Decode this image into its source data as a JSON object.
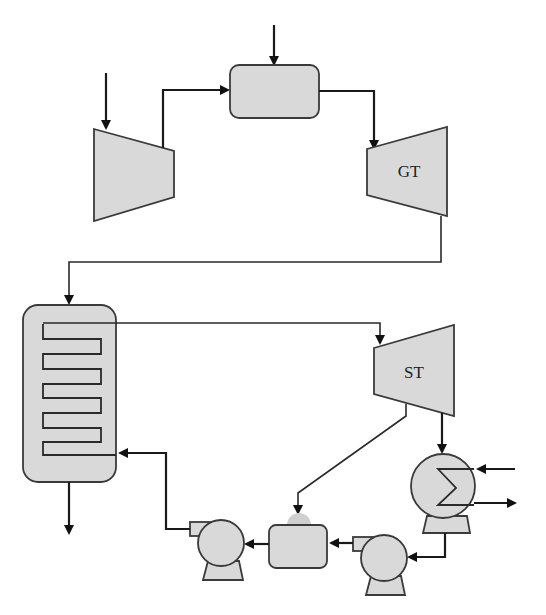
{
  "diagram": {
    "type": "combined-cycle power plant schematic",
    "colors": {
      "fill": "#d9d9d9",
      "stroke": "#3a3a3a",
      "background": "#ffffff"
    },
    "components": [
      {
        "id": "compressor",
        "label": ""
      },
      {
        "id": "combustion-chamber",
        "label": ""
      },
      {
        "id": "gas-turbine",
        "label": "GT"
      },
      {
        "id": "hrsg",
        "label": ""
      },
      {
        "id": "steam-turbine",
        "label": "ST"
      },
      {
        "id": "condenser",
        "label": ""
      },
      {
        "id": "condensate-pump",
        "label": ""
      },
      {
        "id": "deaerator",
        "label": ""
      },
      {
        "id": "feedwater-pump",
        "label": ""
      }
    ],
    "labels": {
      "gas_turbine": "GT",
      "steam_turbine": "ST"
    }
  }
}
